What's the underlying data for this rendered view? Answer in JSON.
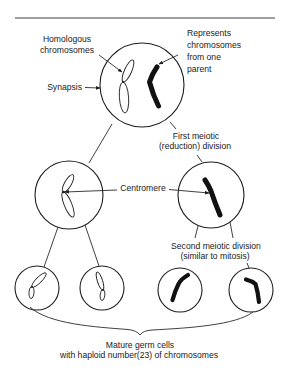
{
  "diagram": {
    "type": "meiosis-schematic",
    "labels": {
      "homologous": [
        "Homologous",
        "chromosomes"
      ],
      "represents": [
        "Represents",
        "chromosomes",
        "from one",
        "parent"
      ],
      "synapsis": "Synapsis",
      "first_division": [
        "First meiotic",
        "(reduction) division"
      ],
      "centromere": "Centromere",
      "second_division": [
        "Second meiotic division",
        "(similar to mitosis)"
      ],
      "mature": [
        "Mature germ cells",
        "with haploid number(23) of chromosomes"
      ]
    },
    "cells": [
      {
        "id": "parent-cell",
        "stage": "synapsis",
        "chromosomes": [
          "homologous-pair-outline",
          "parent-chromosome-solid"
        ]
      },
      {
        "id": "first-division-left",
        "stage": "after first meiotic division",
        "chromosomes": [
          "outline-dyad"
        ]
      },
      {
        "id": "first-division-right",
        "stage": "after first meiotic division",
        "chromosomes": [
          "solid-dyad"
        ]
      },
      {
        "id": "germ-cell-1",
        "stage": "mature",
        "chromosomes": [
          "outline"
        ]
      },
      {
        "id": "germ-cell-2",
        "stage": "mature",
        "chromosomes": [
          "outline"
        ]
      },
      {
        "id": "germ-cell-3",
        "stage": "mature",
        "chromosomes": [
          "solid"
        ]
      },
      {
        "id": "germ-cell-4",
        "stage": "mature",
        "chromosomes": [
          "solid"
        ]
      }
    ],
    "colors": {
      "background": "#ffffff",
      "ink": "#1e1e1e",
      "solid_chromosome": "#111111"
    }
  }
}
